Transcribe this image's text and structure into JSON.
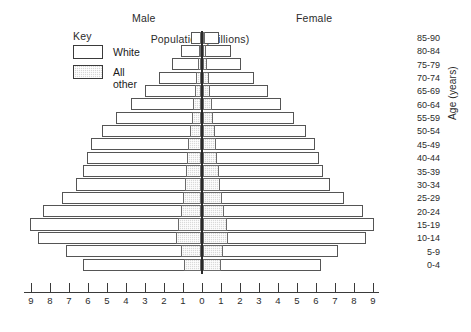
{
  "chart_data": {
    "type": "bar",
    "subtype": "population-pyramid",
    "title": "",
    "xlabel": "Population (millions)",
    "ylabel": "Age (years)",
    "categories": [
      "0-4",
      "5-9",
      "10-14",
      "15-19",
      "20-24",
      "25-29",
      "30-34",
      "35-39",
      "40-44",
      "45-49",
      "50-54",
      "55-59",
      "60-64",
      "65-69",
      "70-74",
      "75-79",
      "80-84",
      "85-90"
    ],
    "categories_top_down": [
      "85-90",
      "80-84",
      "75-79",
      "70-74",
      "65-69",
      "60-64",
      "55-59",
      "50-54",
      "45-49",
      "40-44",
      "35-39",
      "30-34",
      "25-29",
      "20-24",
      "15-19",
      "10-14",
      "5-9",
      "0-4"
    ],
    "xlim": [
      -9,
      9
    ],
    "xticks": [
      9,
      8,
      7,
      6,
      5,
      4,
      3,
      2,
      1,
      0,
      1,
      2,
      3,
      4,
      5,
      6,
      7,
      8,
      9
    ],
    "grid": false,
    "legend_position": "upper-left",
    "series": [
      {
        "name": "Male total",
        "side": "left",
        "values_top_down": [
          0.55,
          1.05,
          1.55,
          2.2,
          2.95,
          3.7,
          4.5,
          5.2,
          5.8,
          6.0,
          6.2,
          6.6,
          7.3,
          8.3,
          9.0,
          8.6,
          7.1,
          6.2
        ]
      },
      {
        "name": "Female total",
        "side": "right",
        "values_top_down": [
          0.85,
          1.45,
          2.0,
          2.7,
          3.4,
          4.1,
          4.8,
          5.4,
          5.9,
          6.1,
          6.3,
          6.7,
          7.4,
          8.4,
          9.0,
          8.6,
          7.1,
          6.2
        ]
      },
      {
        "name": "Male all other",
        "side": "left",
        "values_top_down": [
          0.07,
          0.12,
          0.18,
          0.25,
          0.33,
          0.42,
          0.5,
          0.58,
          0.66,
          0.72,
          0.78,
          0.86,
          0.95,
          1.05,
          1.2,
          1.3,
          1.05,
          0.92
        ]
      },
      {
        "name": "Female all other",
        "side": "right",
        "values_top_down": [
          0.1,
          0.16,
          0.22,
          0.3,
          0.38,
          0.47,
          0.55,
          0.63,
          0.7,
          0.76,
          0.82,
          0.9,
          1.0,
          1.1,
          1.25,
          1.32,
          1.07,
          0.94
        ]
      }
    ]
  },
  "headings": {
    "male": "Male",
    "female": "Female"
  },
  "key": {
    "title": "Key",
    "items": [
      {
        "label": "White",
        "swatch": "white",
        "color": "#ffffff"
      },
      {
        "label": "All other",
        "swatch": "shaded",
        "color": "#d9d9d9"
      }
    ]
  },
  "axes": {
    "x_title": "Population (millions)",
    "y_title": "Age (years)",
    "x_ticks": [
      "9",
      "8",
      "7",
      "6",
      "5",
      "4",
      "3",
      "2",
      "1",
      "0",
      "1",
      "2",
      "3",
      "4",
      "5",
      "6",
      "7",
      "8",
      "9"
    ]
  }
}
